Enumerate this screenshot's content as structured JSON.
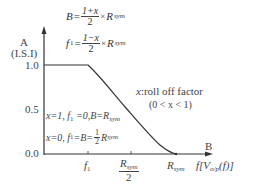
{
  "diagram": {
    "y_axis": {
      "label_top": "A",
      "label_unit": "(I.S.I)",
      "ticks": [
        "1.0",
        "0.5",
        "0.0"
      ]
    },
    "x_axis": {
      "label_end": "B",
      "label_func_prefix": "f",
      "label_func": "[V",
      "label_func_sub": "o/p",
      "label_func_rest": "(f)]",
      "ticks": [
        {
          "main": "f",
          "sub": "1"
        },
        {
          "main": "R",
          "sub": "sym",
          "den": "2"
        },
        {
          "main": "R",
          "sub": "sym"
        }
      ]
    },
    "equations": {
      "B": {
        "lhs": "B",
        "eq": "=",
        "num": "1+x",
        "den": "2",
        "times": "×",
        "R": "R",
        "R_sub": "sym"
      },
      "f1": {
        "lhs": "f",
        "lhs_sub": "1",
        "eq": "=",
        "num": "1−x",
        "den": "2",
        "times": "×",
        "R": "R",
        "R_sub": "sym"
      }
    },
    "annotation": {
      "line1_var": "x",
      "line1_rest": ":roll off factor",
      "line2": "(0 < x < 1)"
    },
    "cases": {
      "case1": {
        "text": "x=1, f",
        "sub": "1",
        "rest": " =0,B=R",
        "rsub": "sym"
      },
      "case2": {
        "text": "x=0, f",
        "sub": "1",
        "rest": " =B= ",
        "num": "1",
        "den": "2",
        "R": "R",
        "rsub": "sym"
      }
    },
    "curve": {
      "type": "raised-cosine roll-off",
      "points": [
        [
          0,
          1.0
        ],
        [
          "f1",
          1.0
        ],
        [
          "Rsym",
          0.0
        ]
      ],
      "color": "#333333"
    }
  }
}
